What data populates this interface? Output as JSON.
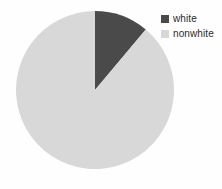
{
  "chart_data": {
    "type": "pie",
    "title": "",
    "categories": [
      "white",
      "nonwhite"
    ],
    "values": [
      11,
      89
    ],
    "value_unit": "percent",
    "colors": [
      "#4a4a4a",
      "#d8d8d8"
    ],
    "start_angle_deg": 0,
    "direction": "clockwise",
    "legend_position": "top-right",
    "grid": false,
    "xlabel": "",
    "ylabel": "",
    "slices": [
      {
        "label": "white",
        "value": 11,
        "color": "#4a4a4a",
        "start_angle_deg": 0,
        "end_angle_deg": 40
      },
      {
        "label": "nonwhite",
        "value": 89,
        "color": "#d8d8d8",
        "start_angle_deg": 40,
        "end_angle_deg": 360
      }
    ]
  },
  "legend": {
    "items": [
      {
        "label": "white",
        "color": "#4a4a4a",
        "swatch_name": "legend-swatch-white"
      },
      {
        "label": "nonwhite",
        "color": "#d8d8d8",
        "swatch_name": "legend-swatch-nonwhite"
      }
    ]
  },
  "geometry": {
    "center_x": 95,
    "center_y": 90,
    "radius": 79
  },
  "colors": {
    "background": "#fefefe",
    "slice_dark": "#4a4a4a",
    "slice_light": "#d8d8d8",
    "text": "#2b2b2b"
  }
}
